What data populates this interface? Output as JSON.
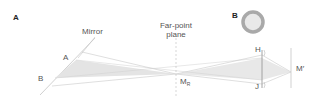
{
  "panels": {
    "a": {
      "label": "A"
    },
    "b": {
      "label": "B"
    }
  },
  "labels": {
    "mirror": "Mirror",
    "far_point_line1": "Far-point",
    "far_point_line2": "plane",
    "point_a": "A",
    "point_b": "B",
    "m_r_main": "M",
    "m_r_sub": "R",
    "h": "H",
    "j": "J",
    "m_prime": "M′"
  },
  "colors": {
    "line": "#b5b5b5",
    "wedge": "#e6e6e6",
    "ring": "#a8a8a8",
    "pupil": "#e8e8e8",
    "text": "#555555"
  }
}
